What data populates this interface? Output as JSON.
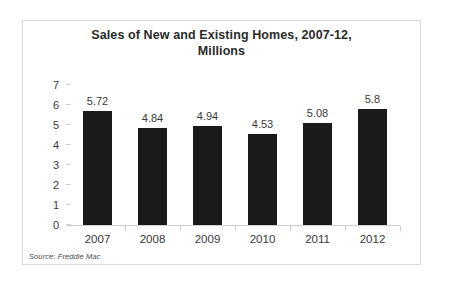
{
  "chart_data": {
    "type": "bar",
    "title": "Sales of New and Existing Homes, 2007-12, Millions",
    "title_lines": [
      "Sales of New and Existing Homes, 2007-12,",
      "Millions"
    ],
    "categories": [
      "2007",
      "2008",
      "2009",
      "2010",
      "2011",
      "2012"
    ],
    "values": [
      5.72,
      4.84,
      4.94,
      4.53,
      5.08,
      5.8
    ],
    "value_labels": [
      "5.72",
      "4.84",
      "4.94",
      "4.53",
      "5.08",
      "5.8"
    ],
    "xlabel": "",
    "ylabel": "",
    "ylim": [
      0,
      7
    ],
    "yticks": [
      0,
      1,
      2,
      3,
      4,
      5,
      6,
      7
    ],
    "ytick_labels": [
      "0",
      "1",
      "2",
      "3",
      "4",
      "5",
      "6",
      "7"
    ],
    "grid": false,
    "legend": false,
    "series_color": "#1a1a1a",
    "axis_color": "#cfcfcf",
    "text_color": "#3a3a3a",
    "background": "#ffffff"
  },
  "source": {
    "note": "Source: Freddie Mac"
  }
}
